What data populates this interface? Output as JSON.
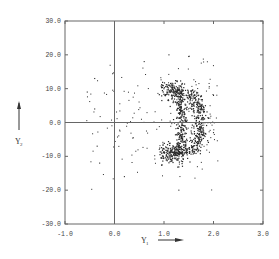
{
  "chart_data": {
    "type": "scatter",
    "title": "",
    "xlabel": "Y",
    "xlabel_subscript": "1",
    "ylabel": "Y",
    "ylabel_subscript": "2",
    "xlim": [
      -1.0,
      3.0
    ],
    "ylim": [
      -30.0,
      30.0
    ],
    "x_ticks": [
      -1.0,
      0.0,
      1.0,
      2.0,
      3.0
    ],
    "x_tick_labels": [
      "-1.0",
      "0.0",
      "1.0",
      "2.0",
      "3.0"
    ],
    "y_ticks": [
      -30.0,
      -20.0,
      -10.0,
      0.0,
      10.0,
      20.0,
      30.0
    ],
    "y_tick_labels": [
      "-30.0",
      "-20.0",
      "-10.0",
      "0.0",
      "10.0",
      "20.0",
      "30.0"
    ],
    "reference_lines": {
      "x": 0.0,
      "y": 0.0
    },
    "grid": false,
    "legend": null,
    "series": [
      {
        "name": "crescent",
        "approx_points": 900,
        "center": [
          1.3,
          0.0
        ],
        "outer_radius_x": 0.45,
        "inner_radius_x": 0.05,
        "radius_y": 9.5,
        "thickness_x": 0.12
      },
      {
        "name": "halo",
        "approx_points": 220,
        "x_range": [
          -0.6,
          2.1
        ],
        "y_range": [
          -20.0,
          20.0
        ]
      }
    ],
    "sample_points": [
      [
        1.2,
        9.0
      ],
      [
        1.45,
        8.0
      ],
      [
        1.6,
        5.0
      ],
      [
        1.75,
        0.0
      ],
      [
        1.6,
        -5.0
      ],
      [
        1.45,
        -8.0
      ],
      [
        1.2,
        -9.0
      ],
      [
        1.3,
        5.0
      ],
      [
        1.3,
        0.0
      ],
      [
        1.3,
        -5.0
      ],
      [
        -0.4,
        13.0
      ],
      [
        -0.55,
        9.0
      ],
      [
        -0.4,
        4.0
      ],
      [
        -0.3,
        -12.0
      ],
      [
        -0.35,
        -7.0
      ],
      [
        0.6,
        18.0
      ],
      [
        1.1,
        20.0
      ],
      [
        1.5,
        19.5
      ],
      [
        1.3,
        -20.0
      ],
      [
        0.2,
        -16.0
      ],
      [
        2.0,
        8.0
      ],
      [
        2.0,
        -3.0
      ]
    ],
    "axis_arrows": {
      "x": "right-pointing arrow after Y1 label",
      "y": "up-pointing arrow above Y2 label"
    }
  },
  "colors": {
    "background": "#ffffff",
    "frame": "#666666",
    "points": "#2a2a2a",
    "text": "#444444"
  },
  "layout": {
    "plot_left": 65,
    "plot_top": 21,
    "plot_right": 263,
    "plot_bottom": 224
  }
}
